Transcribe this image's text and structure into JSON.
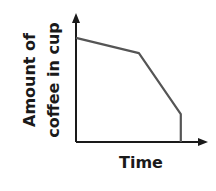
{
  "chart_data": {
    "type": "line",
    "title": "",
    "xlabel": "Time",
    "ylabel": "Amount of coffee in cup",
    "ylabel_lines": [
      "Amount of",
      "coffee in cup"
    ],
    "x_ticks": [],
    "y_ticks": [],
    "grid": false,
    "legend": null,
    "series": [
      {
        "name": "Amount of coffee",
        "points": [
          {
            "x": 0,
            "y": 0.82
          },
          {
            "x": 0.48,
            "y": 0.7
          },
          {
            "x": 0.8,
            "y": 0.22
          },
          {
            "x": 0.8,
            "y": 0
          }
        ]
      }
    ]
  },
  "colors": {
    "axis": "#1a1a1a",
    "line": "#555555",
    "text": "#1a1a1a"
  }
}
